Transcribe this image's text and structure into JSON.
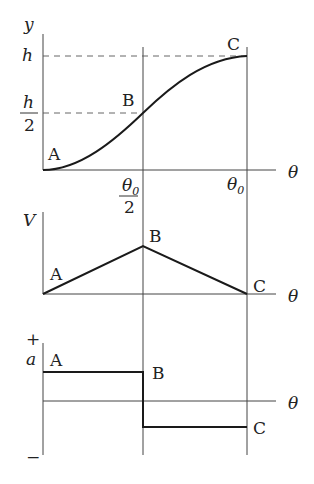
{
  "diagram": {
    "type": "kinematics-graphs",
    "colors": {
      "curve": "#1a1a1a",
      "axis": "#444444",
      "dashed": "#555555",
      "background": "#ffffff"
    },
    "displacement": {
      "y_axis_label": "y",
      "x_axis_label": "θ",
      "y_ticks": {
        "h": "h",
        "half_num": "h",
        "half_den": "2"
      },
      "x_ticks": {
        "half_num": "θ",
        "half_sub": "0",
        "half_den": "2",
        "full": "θ",
        "full_sub": "0"
      },
      "points": {
        "A": "A",
        "B": "B",
        "C": "C"
      }
    },
    "velocity": {
      "y_axis_label": "V",
      "x_axis_label": "θ",
      "points": {
        "A": "A",
        "B": "B",
        "C": "C"
      }
    },
    "acceleration": {
      "y_axis_label": "a",
      "x_axis_label": "θ",
      "plus": "+",
      "minus": "−",
      "points": {
        "A": "A",
        "B": "B",
        "C": "C"
      }
    }
  }
}
